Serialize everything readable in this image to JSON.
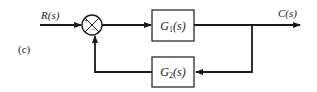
{
  "diagram": {
    "panel_label": "(c)",
    "input_label": "R(s)",
    "output_label": "C(s)",
    "summing_junction": {
      "plus_sign": "+",
      "minus_sign": "−"
    },
    "forward_block": {
      "name": "G",
      "subscript": "1",
      "arg": "(s)"
    },
    "feedback_block": {
      "name": "G",
      "subscript": "2",
      "arg": "(s)"
    },
    "colors": {
      "line": "#1a1a1a",
      "background": "#ffffff"
    }
  }
}
